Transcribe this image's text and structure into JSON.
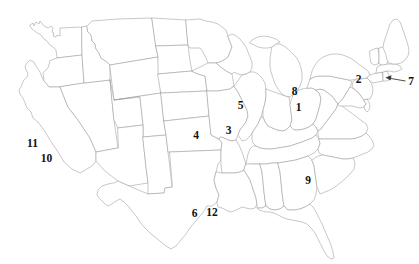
{
  "figure": {
    "background_color": "#ffffff",
    "border_color": "#9a9a9a",
    "label_color": "#111111",
    "leader_color": "#3a3a3a",
    "width": 419,
    "height": 264
  },
  "labels": [
    {
      "id": "label-1",
      "text": "1",
      "x": 298.5,
      "y": 108.0
    },
    {
      "id": "label-2",
      "text": "2",
      "x": 358.5,
      "y": 79.5
    },
    {
      "id": "label-3",
      "text": "3",
      "x": 228.5,
      "y": 131.0
    },
    {
      "id": "label-4",
      "text": "4",
      "x": 196.0,
      "y": 135.5
    },
    {
      "id": "label-5",
      "text": "5",
      "x": 240.5,
      "y": 105.5
    },
    {
      "id": "label-6",
      "text": "6",
      "x": 194.5,
      "y": 214.0
    },
    {
      "id": "label-7",
      "text": "7",
      "x": 411.0,
      "y": 81.5
    },
    {
      "id": "label-8",
      "text": "8",
      "x": 294.5,
      "y": 92.0
    },
    {
      "id": "label-9",
      "text": "9",
      "x": 308.0,
      "y": 181.0
    },
    {
      "id": "label-10",
      "text": "10",
      "x": 46.5,
      "y": 159.0
    },
    {
      "id": "label-11",
      "text": "11",
      "x": 32.5,
      "y": 143.5
    },
    {
      "id": "label-12",
      "text": "12",
      "x": 212.0,
      "y": 212.5
    }
  ],
  "leader_lines": [
    {
      "id": "leader-7",
      "from_label": "7",
      "x1": 405.5,
      "y1": 81.0,
      "x2": 385.5,
      "y2": 78.0
    }
  ]
}
